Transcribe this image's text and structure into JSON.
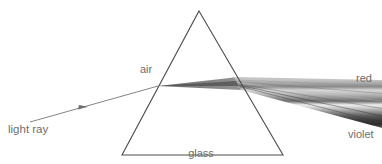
{
  "figure": {
    "kind": "optics-diagram",
    "background_color": "#ffffff",
    "width": 382,
    "height": 164
  },
  "labels": {
    "light_ray": "light ray",
    "air": "air",
    "glass": "glass",
    "prism": "prism",
    "red": "red",
    "violet": "violet",
    "text_color": "#6e6e6e"
  },
  "prism": {
    "name": "glass-prism",
    "shape": "triangle",
    "stroke_color": "#4d4d4d",
    "stroke_width": 1.1,
    "fill": "none",
    "apex": {
      "x": 199,
      "y": 11
    },
    "base_left": {
      "x": 122,
      "y": 155
    },
    "base_right": {
      "x": 283,
      "y": 155
    }
  },
  "incident_ray": {
    "name": "incident-light-ray",
    "stroke_color": "#808080",
    "stroke_width": 1,
    "start": {
      "x": 30,
      "y": 122
    },
    "end": {
      "x": 158,
      "y": 86
    },
    "arrow_at": {
      "x": 83,
      "y": 107
    }
  },
  "refraction_points": {
    "entry": {
      "x": 158,
      "y": 86
    },
    "exit": {
      "x": 237,
      "y": 83
    }
  },
  "spectrum": {
    "name": "dispersed-spectrum-fan",
    "note": "grayscale rendering of a visible spectrum fanning out from the prism exit face",
    "inner_beam_tip": {
      "x": 158,
      "y": 86
    },
    "exit_top": {
      "x": 233,
      "y": 77
    },
    "exit_bottom": {
      "x": 241,
      "y": 90
    },
    "right_edge_x": 382,
    "right_top_y": 80,
    "right_bottom_y": 128,
    "bands": [
      {
        "order": 1,
        "name": "red",
        "color": "#b4b4b4",
        "t_start": 0.0,
        "t_end": 0.1
      },
      {
        "order": 2,
        "name": "orange",
        "color": "#8c8c8c",
        "t_start": 0.1,
        "t_end": 0.2
      },
      {
        "order": 3,
        "name": "yellow",
        "color": "#d9d9d9",
        "t_start": 0.2,
        "t_end": 0.3
      },
      {
        "order": 4,
        "name": "yellow-green",
        "color": "#a6a6a6",
        "t_start": 0.3,
        "t_end": 0.4
      },
      {
        "order": 5,
        "name": "green",
        "color": "#6b6b6b",
        "t_start": 0.4,
        "t_end": 0.5
      },
      {
        "order": 6,
        "name": "cyan",
        "color": "#f2f2f2",
        "t_start": 0.5,
        "t_end": 0.6
      },
      {
        "order": 7,
        "name": "blue",
        "color": "#9e9e9e",
        "t_start": 0.6,
        "t_end": 0.7
      },
      {
        "order": 8,
        "name": "indigo",
        "color": "#4a4a4a",
        "t_start": 0.7,
        "t_end": 0.82
      },
      {
        "order": 9,
        "name": "violet",
        "color": "#2b2b2b",
        "t_start": 0.82,
        "t_end": 1.0
      }
    ]
  }
}
